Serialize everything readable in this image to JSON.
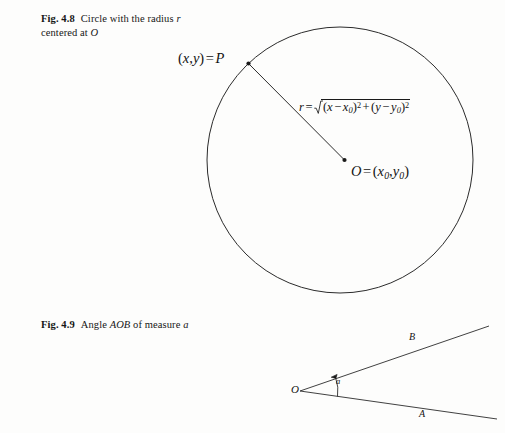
{
  "page": {
    "background_color": "#fdfdfc",
    "ink_color": "#1a1a1a"
  },
  "figures": [
    {
      "id": "fig-4-8",
      "caption": {
        "number": "Fig. 4.8",
        "text_before_italic": "Circle with the radius ",
        "italic_1": "r",
        "text_middle": " centered at ",
        "italic_2": "O"
      },
      "shape": "circle",
      "geometry": {
        "center_x": 340,
        "center_y": 160,
        "radius": 133,
        "point_p_x": 248,
        "point_p_y": 63
      },
      "labels": {
        "point_p": "(x, y) = P",
        "center": "O = (x0, y0)",
        "radius_formula": "r = sqrt((x - x0)^2 + (y - y0)^2)"
      }
    },
    {
      "id": "fig-4-9",
      "caption": {
        "number": "Fig. 4.9",
        "text_before_italic": "Angle ",
        "italic_1": "AOB",
        "text_middle": " of measure ",
        "italic_2": "a"
      },
      "shape": "angle",
      "geometry": {
        "vertex_x": 300,
        "vertex_y": 391,
        "ray_a_end_x": 497,
        "ray_a_end_y": 419,
        "ray_b_end_x": 489,
        "ray_b_end_y": 326,
        "arc_radius": 38
      },
      "labels": {
        "vertex": "O",
        "ray_a": "A",
        "ray_b": "B",
        "measure": "a"
      }
    }
  ],
  "math": {
    "point_p": {
      "open": "(",
      "x": "x",
      "comma": ",",
      "y": "y",
      "close": ")",
      "equals": "=",
      "p": "P"
    },
    "center": {
      "o": "O",
      "equals": "=",
      "open": "(",
      "x": "x",
      "x_sub": "0",
      "comma": ",",
      "y": "y",
      "y_sub": "0",
      "close": ")"
    },
    "radius": {
      "r": "r",
      "equals": "=",
      "term1_open": "(",
      "term1_x": "x",
      "term1_minus": "−",
      "term1_x0": "x",
      "term1_x0_sub": "0",
      "term1_close": ")",
      "term1_exp": "2",
      "plus": "+",
      "term2_open": "(",
      "term2_y": "y",
      "term2_minus": "−",
      "term2_y0": "y",
      "term2_y0_sub": "0",
      "term2_close": ")",
      "term2_exp": "2"
    }
  }
}
